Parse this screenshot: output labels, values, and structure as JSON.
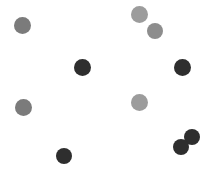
{
  "canvas": {
    "width": 213,
    "height": 174,
    "background": "#ffffff",
    "description": "Scattered circular dots on a plain white background"
  },
  "palette": {
    "dark": "#2e2e2e",
    "medium_gray": "#7b7b7b",
    "light_gray": "#9c9c9c",
    "background": "#ffffff"
  },
  "dots": [
    {
      "id": "dot-1",
      "x": 22,
      "y": 25,
      "r": 8.5,
      "color": "#7b7b7b",
      "shade": "medium-gray"
    },
    {
      "id": "dot-2",
      "x": 139,
      "y": 14,
      "r": 8.5,
      "color": "#9c9c9c",
      "shade": "light-gray"
    },
    {
      "id": "dot-3",
      "x": 155,
      "y": 31,
      "r": 8.0,
      "color": "#8d8d8d",
      "shade": "light-gray"
    },
    {
      "id": "dot-4",
      "x": 82,
      "y": 67,
      "r": 8.5,
      "color": "#2e2e2e",
      "shade": "dark"
    },
    {
      "id": "dot-5",
      "x": 182,
      "y": 67,
      "r": 8.5,
      "color": "#2e2e2e",
      "shade": "dark"
    },
    {
      "id": "dot-6",
      "x": 23,
      "y": 107,
      "r": 8.5,
      "color": "#7b7b7b",
      "shade": "medium-gray"
    },
    {
      "id": "dot-7",
      "x": 139,
      "y": 102,
      "r": 8.5,
      "color": "#9c9c9c",
      "shade": "light-gray"
    },
    {
      "id": "dot-8",
      "x": 192,
      "y": 137,
      "r": 8.0,
      "color": "#2e2e2e",
      "shade": "dark"
    },
    {
      "id": "dot-9",
      "x": 181,
      "y": 147,
      "r": 8.0,
      "color": "#2e2e2e",
      "shade": "dark"
    },
    {
      "id": "dot-10",
      "x": 64,
      "y": 156,
      "r": 8.0,
      "color": "#2e2e2e",
      "shade": "dark"
    }
  ],
  "counts": {
    "total": 10,
    "dark": 5,
    "gray": 5
  }
}
